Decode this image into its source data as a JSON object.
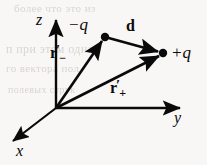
{
  "figure": {
    "type": "physics-vector-diagram",
    "background_color": "#f8f7f5",
    "ink_color": "#0a0a0a",
    "width": 207,
    "height": 165
  },
  "axes": [
    {
      "name": "z",
      "label": "z",
      "label_x": 36,
      "label_y": 12,
      "direction": "up"
    },
    {
      "name": "y",
      "label": "y",
      "label_x": 174,
      "label_y": 110,
      "direction": "right"
    },
    {
      "name": "x",
      "label": "x",
      "label_x": 16,
      "label_y": 143,
      "direction": "down-left"
    }
  ],
  "origin": {
    "x": 56,
    "y": 108
  },
  "charges": [
    {
      "name": "negative-charge",
      "sign": "−",
      "symbol": "q",
      "label": "−q",
      "point_x": 105,
      "point_y": 37,
      "label_x": 68,
      "label_y": 16
    },
    {
      "name": "positive-charge",
      "sign": "+",
      "symbol": "q",
      "label": "+q",
      "point_x": 163,
      "point_y": 53,
      "label_x": 171,
      "label_y": 44
    }
  ],
  "vectors": [
    {
      "name": "r-minus-vector",
      "base": "r",
      "prime": "′",
      "subscript": "−",
      "from_x": 56,
      "from_y": 108,
      "to_x": 105,
      "to_y": 37,
      "label_x": 50,
      "label_y": 45
    },
    {
      "name": "r-plus-vector",
      "base": "r",
      "prime": "′",
      "subscript": "+",
      "from_x": 56,
      "from_y": 108,
      "to_x": 163,
      "to_y": 53,
      "label_x": 110,
      "label_y": 80
    },
    {
      "name": "d-vector",
      "base": "d",
      "prime": "",
      "subscript": "",
      "from_x": 105,
      "from_y": 37,
      "to_x": 163,
      "to_y": 53,
      "label_x": 126,
      "label_y": 18
    }
  ],
  "ghost_text": [
    {
      "text": "более  что это из",
      "x": 14,
      "y": 2,
      "size": 11
    },
    {
      "text": "п при  этом  одна",
      "x": 6,
      "y": 42,
      "size": 12
    },
    {
      "text": "го  вектора  пол",
      "x": 6,
      "y": 62,
      "size": 11
    },
    {
      "text": "полевых струк",
      "x": 8,
      "y": 84,
      "size": 10
    }
  ]
}
